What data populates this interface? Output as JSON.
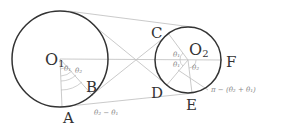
{
  "diagram": {
    "points": {
      "O1": {
        "label": "O",
        "sub": "1"
      },
      "O2": {
        "label": "O",
        "sub": "2"
      },
      "A": {
        "label": "A"
      },
      "B": {
        "label": "B"
      },
      "C": {
        "label": "C"
      },
      "D": {
        "label": "D"
      },
      "E": {
        "label": "E"
      },
      "F": {
        "label": "F"
      }
    },
    "angles": {
      "left_theta1": "θ₁",
      "left_theta2": "θ₂",
      "right_theta1_top": "θ₁",
      "right_theta1_bottom": "θ₁",
      "right_theta2": "θ₂",
      "diff_label": "θ₂ − θ₁",
      "sum_label": "π − (θ₂ + θ₁)"
    },
    "colors": {
      "circle": "#333333",
      "line": "#bbbbbb",
      "label": "#333333",
      "angle_label": "#888888"
    }
  }
}
